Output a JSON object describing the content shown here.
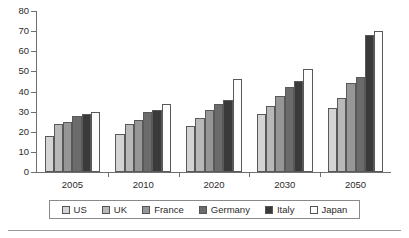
{
  "chart_data": {
    "type": "bar",
    "title": "",
    "subtitle": "",
    "xlabel": "",
    "ylabel": "",
    "categories": [
      "2005",
      "2010",
      "2020",
      "2030",
      "2050"
    ],
    "ylim": [
      0,
      80
    ],
    "yticks": [
      0,
      10,
      20,
      30,
      40,
      50,
      60,
      70,
      80
    ],
    "ytick_labels": [
      "0",
      "10",
      "20",
      "30",
      "40",
      "50",
      "60",
      "70",
      "80"
    ],
    "grid": false,
    "legend_position": "bottom",
    "series": [
      {
        "name": "US",
        "color": "#d4d4d4",
        "values": [
          18,
          19,
          23,
          29,
          32
        ]
      },
      {
        "name": "UK",
        "color": "#b8b8b8",
        "values": [
          24,
          24,
          27,
          33,
          37
        ]
      },
      {
        "name": "France",
        "color": "#969696",
        "values": [
          25,
          26,
          31,
          38,
          44
        ]
      },
      {
        "name": "Germany",
        "color": "#6b6b6b",
        "values": [
          28,
          30,
          34,
          42,
          47
        ]
      },
      {
        "name": "Italy",
        "color": "#3a3a3a",
        "values": [
          29,
          31,
          36,
          45,
          68
        ]
      },
      {
        "name": "Japan",
        "color": "#fdfdfd",
        "values": [
          30,
          34,
          46,
          51,
          70
        ]
      }
    ]
  },
  "legend": {
    "items": [
      {
        "label": "US",
        "color": "#d4d4d4"
      },
      {
        "label": "UK",
        "color": "#b8b8b8"
      },
      {
        "label": "France",
        "color": "#969696"
      },
      {
        "label": "Germany",
        "color": "#6b6b6b"
      },
      {
        "label": "Italy",
        "color": "#3a3a3a"
      },
      {
        "label": "Japan",
        "color": "#fdfdfd"
      }
    ]
  }
}
